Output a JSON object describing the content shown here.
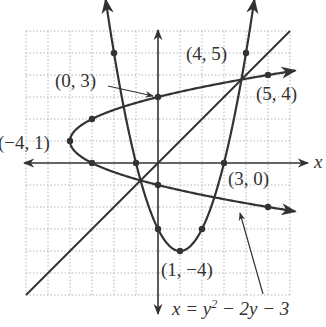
{
  "figure": {
    "axes": {
      "x_label": "x",
      "y_label": "y",
      "x_range": [
        -6,
        6
      ],
      "y_range": [
        -6,
        6
      ],
      "grid": true,
      "grid_step": 1
    },
    "colors": {
      "curve": "#333333",
      "grid": "#b5b5b5",
      "background": "#ffffff"
    },
    "curves": [
      {
        "name": "parabola-vertical",
        "equation": "y = x^2 - 2x - 3",
        "points": [
          [
            -2,
            5
          ],
          [
            -1,
            0
          ],
          [
            0,
            -3
          ],
          [
            1,
            -4
          ],
          [
            2,
            -3
          ],
          [
            3,
            0
          ],
          [
            4,
            5
          ]
        ]
      },
      {
        "name": "parabola-horizontal",
        "equation": "x = y^2 - 2y - 3",
        "points": [
          [
            5,
            -2
          ],
          [
            0,
            -1
          ],
          [
            -3,
            0
          ],
          [
            -4,
            1
          ],
          [
            -3,
            2
          ],
          [
            0,
            3
          ],
          [
            5,
            4
          ]
        ]
      },
      {
        "name": "line",
        "equation": "y = x",
        "from": [
          -6,
          -6
        ],
        "to": [
          6,
          6
        ]
      }
    ],
    "labels": {
      "p_0_3": "(0, 3)",
      "p_4_5": "(4, 5)",
      "p_5_4": "(5, 4)",
      "p_m4_1": "(−4, 1)",
      "p_3_0": "(3, 0)",
      "p_1_m4": "(1, −4)",
      "eq_x": "x = y",
      "eq_exp": "2",
      "eq_rest": " − 2y − 3"
    }
  }
}
